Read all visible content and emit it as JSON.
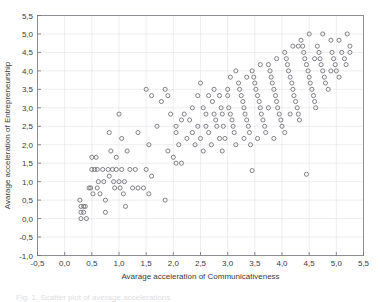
{
  "figure": {
    "caption_fragment": "Fig. 1. Scatter plot of average accelerations"
  },
  "chart_data": {
    "type": "scatter",
    "title": "",
    "xlabel": "Avarage acceleration of Communicativeness",
    "ylabel": "Avarage acceleration of Entrepreneurship",
    "xlim": [
      -0.5,
      5.5
    ],
    "ylim": [
      -1.0,
      5.5
    ],
    "xticks": [
      -0.5,
      0.0,
      0.5,
      1.0,
      1.5,
      2.0,
      2.5,
      3.0,
      3.5,
      4.0,
      4.5,
      5.0,
      5.5
    ],
    "yticks": [
      -1.0,
      -0.5,
      0.0,
      0.5,
      1.0,
      1.5,
      2.0,
      2.5,
      3.0,
      3.5,
      4.0,
      4.5,
      5.0,
      5.5
    ],
    "xtick_labels": [
      "-0,5",
      "0,0",
      "0,5",
      "1,0",
      "1,5",
      "2,0",
      "2,5",
      "3,0",
      "3,5",
      "4,0",
      "4,5",
      "5,0",
      "5,5"
    ],
    "ytick_labels": [
      "-1,0",
      "-0,5",
      "0,0",
      "0,5",
      "1,0",
      "1,5",
      "2,0",
      "2,5",
      "3,0",
      "3,5",
      "4,0",
      "4,5",
      "5,0",
      "5,5"
    ],
    "grid": true,
    "legend": "none",
    "marker": "open-circle",
    "marker_color": "#6b6b72",
    "points": [
      [
        0.28,
        0.5
      ],
      [
        0.3,
        0.33
      ],
      [
        0.3,
        0.17
      ],
      [
        0.3,
        0.0
      ],
      [
        0.35,
        0.33
      ],
      [
        0.35,
        0.17
      ],
      [
        0.38,
        0.33
      ],
      [
        0.4,
        0.0
      ],
      [
        0.45,
        0.83
      ],
      [
        0.48,
        0.83
      ],
      [
        0.5,
        1.33
      ],
      [
        0.5,
        1.66
      ],
      [
        0.52,
        0.67
      ],
      [
        0.55,
        1.33
      ],
      [
        0.58,
        1.66
      ],
      [
        0.6,
        1.33
      ],
      [
        0.6,
        0.83
      ],
      [
        0.62,
        1.0
      ],
      [
        0.65,
        0.67
      ],
      [
        0.7,
        1.33
      ],
      [
        0.72,
        1.0
      ],
      [
        0.75,
        0.5
      ],
      [
        0.75,
        0.17
      ],
      [
        0.8,
        1.33
      ],
      [
        0.82,
        1.15
      ],
      [
        0.85,
        1.83
      ],
      [
        0.88,
        1.33
      ],
      [
        0.9,
        1.0
      ],
      [
        0.92,
        0.83
      ],
      [
        0.95,
        1.33
      ],
      [
        1.0,
        1.0
      ],
      [
        1.02,
        0.83
      ],
      [
        1.05,
        1.33
      ],
      [
        1.08,
        0.67
      ],
      [
        1.1,
        1.0
      ],
      [
        1.12,
        0.33
      ],
      [
        1.2,
        1.33
      ],
      [
        1.25,
        0.83
      ],
      [
        1.3,
        1.33
      ],
      [
        1.35,
        0.83
      ],
      [
        1.45,
        0.83
      ],
      [
        1.5,
        1.33
      ],
      [
        1.55,
        0.67
      ],
      [
        1.6,
        1.15
      ],
      [
        1.85,
        0.5
      ],
      [
        1.9,
        1.83
      ],
      [
        2.0,
        1.66
      ],
      [
        2.05,
        1.5
      ],
      [
        2.15,
        1.5
      ],
      [
        0.82,
        2.33
      ],
      [
        1.05,
        2.17
      ],
      [
        1.0,
        2.83
      ],
      [
        1.5,
        3.5
      ],
      [
        1.6,
        3.33
      ],
      [
        1.78,
        3.17
      ],
      [
        1.85,
        3.5
      ],
      [
        1.9,
        3.33
      ],
      [
        2.05,
        2.5
      ],
      [
        2.05,
        2.33
      ],
      [
        2.1,
        2.0
      ],
      [
        2.2,
        2.83
      ],
      [
        2.3,
        2.67
      ],
      [
        2.35,
        2.33
      ],
      [
        2.4,
        2.0
      ],
      [
        2.45,
        2.5
      ],
      [
        2.5,
        2.17
      ],
      [
        2.55,
        3.0
      ],
      [
        2.6,
        2.83
      ],
      [
        2.6,
        2.5
      ],
      [
        2.65,
        2.33
      ],
      [
        2.7,
        2.0
      ],
      [
        2.72,
        3.17
      ],
      [
        2.75,
        2.83
      ],
      [
        2.78,
        2.67
      ],
      [
        2.8,
        2.5
      ],
      [
        2.85,
        3.33
      ],
      [
        2.88,
        3.0
      ],
      [
        2.9,
        2.83
      ],
      [
        2.92,
        2.5
      ],
      [
        2.95,
        2.17
      ],
      [
        3.0,
        3.5
      ],
      [
        3.0,
        3.33
      ],
      [
        3.02,
        3.0
      ],
      [
        3.05,
        2.83
      ],
      [
        3.08,
        2.67
      ],
      [
        3.1,
        2.5
      ],
      [
        3.12,
        2.33
      ],
      [
        3.15,
        2.0
      ],
      [
        3.2,
        3.67
      ],
      [
        3.22,
        3.5
      ],
      [
        3.25,
        3.33
      ],
      [
        3.28,
        3.17
      ],
      [
        3.3,
        3.0
      ],
      [
        3.32,
        2.83
      ],
      [
        3.35,
        2.67
      ],
      [
        3.38,
        2.5
      ],
      [
        3.4,
        2.33
      ],
      [
        3.42,
        2.0
      ],
      [
        3.45,
        4.0
      ],
      [
        3.48,
        3.83
      ],
      [
        3.5,
        3.67
      ],
      [
        3.52,
        3.5
      ],
      [
        3.55,
        3.33
      ],
      [
        3.58,
        3.17
      ],
      [
        3.6,
        3.0
      ],
      [
        3.62,
        2.83
      ],
      [
        3.65,
        2.67
      ],
      [
        3.68,
        2.5
      ],
      [
        3.7,
        2.33
      ],
      [
        3.75,
        4.17
      ],
      [
        3.78,
        4.0
      ],
      [
        3.8,
        3.83
      ],
      [
        3.82,
        3.67
      ],
      [
        3.85,
        3.5
      ],
      [
        3.88,
        3.33
      ],
      [
        3.9,
        3.17
      ],
      [
        3.92,
        3.0
      ],
      [
        3.95,
        2.83
      ],
      [
        3.98,
        2.67
      ],
      [
        4.0,
        2.5
      ],
      [
        4.05,
        4.5
      ],
      [
        4.08,
        4.33
      ],
      [
        4.1,
        4.17
      ],
      [
        4.12,
        4.0
      ],
      [
        4.15,
        3.83
      ],
      [
        4.18,
        3.67
      ],
      [
        4.2,
        3.5
      ],
      [
        4.22,
        3.33
      ],
      [
        4.25,
        3.17
      ],
      [
        4.28,
        3.0
      ],
      [
        4.3,
        2.83
      ],
      [
        4.32,
        2.67
      ],
      [
        4.35,
        4.83
      ],
      [
        4.38,
        4.67
      ],
      [
        4.4,
        4.5
      ],
      [
        4.42,
        4.33
      ],
      [
        4.45,
        4.17
      ],
      [
        4.48,
        4.0
      ],
      [
        4.5,
        3.83
      ],
      [
        4.52,
        3.67
      ],
      [
        4.55,
        3.5
      ],
      [
        4.58,
        3.33
      ],
      [
        4.6,
        3.17
      ],
      [
        4.62,
        3.0
      ],
      [
        4.65,
        4.67
      ],
      [
        4.68,
        4.5
      ],
      [
        4.7,
        4.33
      ],
      [
        4.72,
        4.17
      ],
      [
        4.75,
        4.0
      ],
      [
        4.78,
        3.83
      ],
      [
        4.8,
        3.67
      ],
      [
        4.85,
        3.5
      ],
      [
        4.9,
        4.83
      ],
      [
        4.92,
        4.5
      ],
      [
        4.95,
        4.33
      ],
      [
        4.98,
        4.17
      ],
      [
        5.0,
        4.0
      ],
      [
        5.05,
        3.83
      ],
      [
        5.1,
        4.5
      ],
      [
        5.15,
        4.33
      ],
      [
        5.18,
        4.17
      ],
      [
        5.2,
        5.0
      ],
      [
        5.25,
        4.67
      ],
      [
        4.75,
        5.0
      ],
      [
        4.5,
        5.0
      ],
      [
        4.3,
        4.67
      ],
      [
        4.05,
        2.33
      ],
      [
        3.3,
        2.17
      ],
      [
        2.9,
        1.83
      ],
      [
        3.45,
        1.3
      ],
      [
        4.45,
        1.2
      ],
      [
        2.55,
        1.83
      ],
      [
        2.45,
        3.33
      ],
      [
        2.35,
        3.0
      ],
      [
        2.65,
        3.33
      ],
      [
        2.75,
        3.5
      ],
      [
        3.05,
        3.83
      ],
      [
        3.35,
        3.83
      ],
      [
        3.15,
        4.0
      ],
      [
        3.6,
        4.17
      ],
      [
        3.9,
        4.33
      ],
      [
        4.2,
        4.67
      ],
      [
        4.6,
        4.33
      ],
      [
        4.9,
        4.0
      ],
      [
        2.15,
        2.67
      ],
      [
        2.25,
        2.17
      ],
      [
        1.95,
        2.83
      ],
      [
        1.7,
        2.5
      ],
      [
        1.35,
        2.33
      ],
      [
        1.55,
        2.0
      ],
      [
        1.15,
        1.83
      ],
      [
        0.95,
        1.66
      ],
      [
        2.85,
        2.17
      ],
      [
        3.55,
        2.17
      ],
      [
        3.85,
        2.17
      ],
      [
        2.5,
        3.67
      ],
      [
        5.05,
        4.83
      ],
      [
        5.25,
        4.5
      ],
      [
        3.75,
        3.0
      ],
      [
        4.15,
        2.83
      ]
    ]
  }
}
